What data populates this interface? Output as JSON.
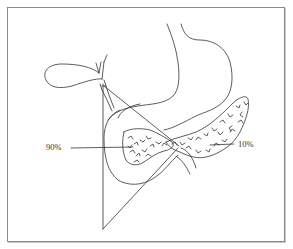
{
  "figure": {
    "type": "anatomical-line-drawing",
    "labels": [
      {
        "id": "head",
        "text": "90%"
      },
      {
        "id": "tail",
        "text": "10%"
      }
    ],
    "colors": {
      "line": "#333333",
      "frame": "#8a8a8a",
      "background": "#ffffff"
    }
  }
}
